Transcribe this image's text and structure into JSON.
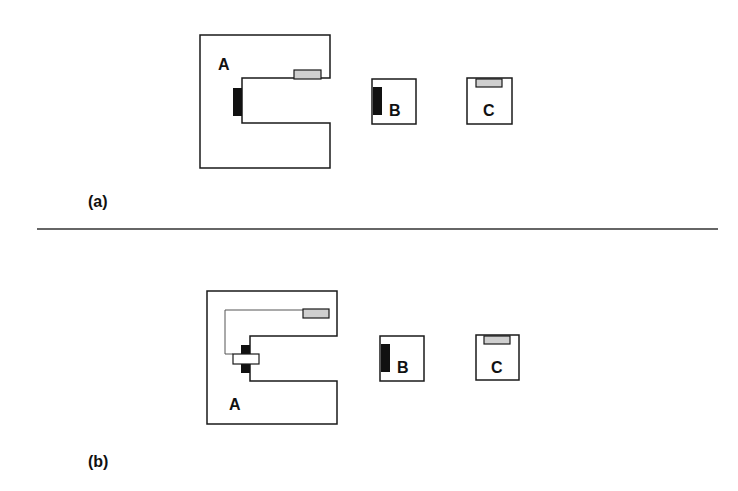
{
  "panels": [
    {
      "caption": "(a)",
      "components": [
        {
          "label": "A",
          "shape": "c-shaped-block",
          "has_black_pad": true,
          "has_gray_pad": true,
          "connected": false
        },
        {
          "label": "B",
          "shape": "square-block",
          "has_black_pad": true
        },
        {
          "label": "C",
          "shape": "square-block",
          "has_gray_pad": true
        }
      ]
    },
    {
      "caption": "(b)",
      "components": [
        {
          "label": "A",
          "shape": "c-shaped-block",
          "has_black_pad": true,
          "has_gray_pad": true,
          "connected": true,
          "connector": "white-bar-across-black-pads",
          "wire": "thin-line-from-gray-pad-to-connector"
        },
        {
          "label": "B",
          "shape": "square-block",
          "has_black_pad": true
        },
        {
          "label": "C",
          "shape": "square-block",
          "has_gray_pad": true
        }
      ]
    }
  ],
  "colors": {
    "outline": "#1a1a1a",
    "black_pad": "#111111",
    "gray_pad": "#cfcfcf",
    "wire": "#555555",
    "divider": "#333333"
  }
}
